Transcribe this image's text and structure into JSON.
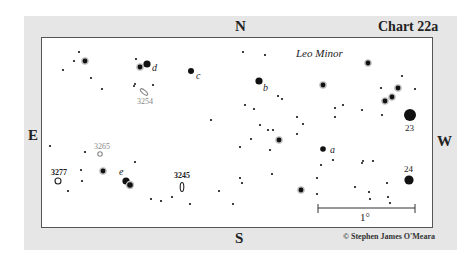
{
  "chart": {
    "title": "Chart 22a",
    "constellation": "Leo Minor",
    "credit": "© Stephen James O'Meara",
    "directions": {
      "north": "N",
      "south": "S",
      "east": "E",
      "west": "W"
    },
    "scale_bar": {
      "label": "1°",
      "x1": 318,
      "x2": 415,
      "y": 208
    },
    "colors": {
      "panel": "#e6e6e6",
      "frame": "#555555",
      "star": "#111111",
      "galaxy_gray": "#888888"
    }
  },
  "stars": [
    {
      "x": 79,
      "y": 52,
      "r": 1.1
    },
    {
      "x": 74,
      "y": 61,
      "r": 1.1
    },
    {
      "x": 85,
      "y": 61,
      "r": 2.4,
      "halo": true
    },
    {
      "x": 63,
      "y": 70,
      "r": 1.1
    },
    {
      "x": 91,
      "y": 78,
      "r": 1.1
    },
    {
      "x": 102,
      "y": 89,
      "r": 1.1
    },
    {
      "x": 136,
      "y": 59,
      "r": 1.1
    },
    {
      "x": 140,
      "y": 67,
      "r": 2.4,
      "halo": true
    },
    {
      "x": 147,
      "y": 64,
      "r": 3.6
    },
    {
      "x": 134,
      "y": 86,
      "r": 1.0
    },
    {
      "x": 135,
      "y": 84,
      "r": 1.0
    },
    {
      "x": 153,
      "y": 85,
      "r": 1.1
    },
    {
      "x": 191,
      "y": 71,
      "r": 3.0
    },
    {
      "x": 243,
      "y": 52,
      "r": 1.1
    },
    {
      "x": 265,
      "y": 55,
      "r": 1.1
    },
    {
      "x": 259,
      "y": 81,
      "r": 3.6
    },
    {
      "x": 278,
      "y": 96,
      "r": 1.1
    },
    {
      "x": 282,
      "y": 99,
      "r": 1.1
    },
    {
      "x": 245,
      "y": 105,
      "r": 1.1
    },
    {
      "x": 254,
      "y": 109,
      "r": 1.1
    },
    {
      "x": 211,
      "y": 120,
      "r": 1.1
    },
    {
      "x": 368,
      "y": 63,
      "r": 2.4,
      "halo": true
    },
    {
      "x": 323,
      "y": 85,
      "r": 2.4,
      "halo": true
    },
    {
      "x": 402,
      "y": 76,
      "r": 1.1
    },
    {
      "x": 381,
      "y": 88,
      "r": 1.1
    },
    {
      "x": 398,
      "y": 88,
      "r": 2.4,
      "halo": true
    },
    {
      "x": 392,
      "y": 97,
      "r": 2.4,
      "halo": true
    },
    {
      "x": 385,
      "y": 101,
      "r": 2.4,
      "halo": true
    },
    {
      "x": 415,
      "y": 89,
      "r": 1.1
    },
    {
      "x": 335,
      "y": 108,
      "r": 1.1
    },
    {
      "x": 343,
      "y": 105,
      "r": 1.1
    },
    {
      "x": 362,
      "y": 110,
      "r": 1.1
    },
    {
      "x": 335,
      "y": 117,
      "r": 1.1
    },
    {
      "x": 382,
      "y": 115,
      "r": 1.1
    },
    {
      "x": 410,
      "y": 115,
      "r": 6.0
    },
    {
      "x": 297,
      "y": 117,
      "r": 1.1
    },
    {
      "x": 303,
      "y": 124,
      "r": 1.1
    },
    {
      "x": 260,
      "y": 125,
      "r": 1.1
    },
    {
      "x": 268,
      "y": 130,
      "r": 1.1
    },
    {
      "x": 273,
      "y": 130,
      "r": 1.1
    },
    {
      "x": 251,
      "y": 139,
      "r": 1.1
    },
    {
      "x": 279,
      "y": 140,
      "r": 2.4,
      "halo": true
    },
    {
      "x": 240,
      "y": 147,
      "r": 1.1
    },
    {
      "x": 270,
      "y": 150,
      "r": 1.1
    },
    {
      "x": 297,
      "y": 134,
      "r": 1.1
    },
    {
      "x": 323,
      "y": 149,
      "r": 2.8
    },
    {
      "x": 321,
      "y": 165,
      "r": 1.1
    },
    {
      "x": 333,
      "y": 160,
      "r": 1.1
    },
    {
      "x": 362,
      "y": 163,
      "r": 1.0
    },
    {
      "x": 363,
      "y": 161,
      "r": 1.0
    },
    {
      "x": 373,
      "y": 161,
      "r": 1.1
    },
    {
      "x": 317,
      "y": 178,
      "r": 1.1
    },
    {
      "x": 272,
      "y": 174,
      "r": 1.1
    },
    {
      "x": 240,
      "y": 178,
      "r": 1.1
    },
    {
      "x": 242,
      "y": 183,
      "r": 1.1
    },
    {
      "x": 219,
      "y": 191,
      "r": 1.1
    },
    {
      "x": 233,
      "y": 204,
      "r": 1.1
    },
    {
      "x": 301,
      "y": 190,
      "r": 2.4,
      "halo": true
    },
    {
      "x": 317,
      "y": 194,
      "r": 1.1
    },
    {
      "x": 355,
      "y": 187,
      "r": 1.1
    },
    {
      "x": 369,
      "y": 192,
      "r": 1.1
    },
    {
      "x": 370,
      "y": 199,
      "r": 1.1
    },
    {
      "x": 387,
      "y": 183,
      "r": 1.1
    },
    {
      "x": 388,
      "y": 197,
      "r": 1.1
    },
    {
      "x": 390,
      "y": 203,
      "r": 1.1
    },
    {
      "x": 409,
      "y": 180,
      "r": 4.6
    },
    {
      "x": 50,
      "y": 146,
      "r": 1.1
    },
    {
      "x": 85,
      "y": 152,
      "r": 1.1
    },
    {
      "x": 135,
      "y": 162,
      "r": 1.1
    },
    {
      "x": 81,
      "y": 170,
      "r": 1.1
    },
    {
      "x": 103,
      "y": 171,
      "r": 2.4,
      "halo": true
    },
    {
      "x": 82,
      "y": 181,
      "r": 1.1
    },
    {
      "x": 68,
      "y": 191,
      "r": 1.1
    },
    {
      "x": 126,
      "y": 181,
      "r": 3.6
    },
    {
      "x": 130,
      "y": 185,
      "r": 2.8,
      "halo": true
    },
    {
      "x": 151,
      "y": 199,
      "r": 1.1
    },
    {
      "x": 161,
      "y": 201,
      "r": 1.1
    },
    {
      "x": 172,
      "y": 197,
      "r": 1.1
    },
    {
      "x": 190,
      "y": 204,
      "r": 1.1
    }
  ],
  "star_labels": [
    {
      "text": "d",
      "x": 152,
      "y": 71,
      "italic": true
    },
    {
      "text": "c",
      "x": 196,
      "y": 79,
      "italic": true
    },
    {
      "text": "b",
      "x": 263,
      "y": 91,
      "italic": true
    },
    {
      "text": "a",
      "x": 330,
      "y": 153,
      "italic": true
    },
    {
      "text": "e",
      "x": 119,
      "y": 175,
      "italic": true
    },
    {
      "text": "23",
      "x": 405,
      "y": 131,
      "italic": false
    },
    {
      "text": "24",
      "x": 404,
      "y": 172,
      "italic": false
    }
  ],
  "galaxies": [
    {
      "id": "3254",
      "label": "3254",
      "x": 144,
      "y": 92,
      "label_x": 137,
      "label_y": 104,
      "shape": "ellipse",
      "rx": 4.5,
      "ry": 1.8,
      "rot": 40,
      "gray": true
    },
    {
      "id": "3265",
      "label": "3265",
      "x": 100,
      "y": 154,
      "label_x": 94,
      "label_y": 149,
      "shape": "circle",
      "rx": 2.2,
      "ry": 2.2,
      "rot": 0,
      "gray": true
    },
    {
      "id": "3277",
      "label": "3277",
      "x": 58,
      "y": 181,
      "label_x": 51,
      "label_y": 175,
      "shape": "circle",
      "rx": 3.0,
      "ry": 3.0,
      "rot": 0,
      "gray": false
    },
    {
      "id": "3245",
      "label": "3245",
      "x": 182,
      "y": 187,
      "label_x": 174,
      "label_y": 178,
      "shape": "ellipse",
      "rx": 1.8,
      "ry": 4.5,
      "rot": 0,
      "gray": false
    }
  ]
}
